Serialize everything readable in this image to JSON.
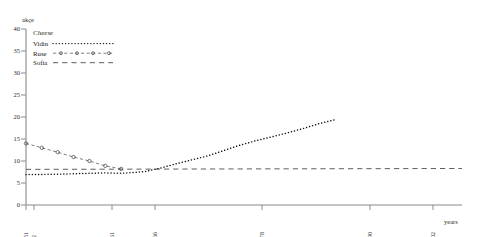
{
  "figure": {
    "axis_title_y": "akçe",
    "axis_title_x": "years",
    "legend_title": "Cheese",
    "legend_items": [
      {
        "label": "Vidin",
        "style": "dotted"
      },
      {
        "label": "Ruse",
        "style": "dashed-circles"
      },
      {
        "label": "Sofia",
        "style": "long-dashed"
      }
    ],
    "y_ticks": [
      "0",
      "5",
      "10",
      "15",
      "20",
      "25",
      "30",
      "35",
      "40"
    ],
    "x_ticks": [
      "1751",
      "1752",
      "1761",
      "1766",
      "1778",
      "1790",
      "1802"
    ]
  },
  "chart_data": {
    "type": "line",
    "title": "Cheese",
    "xlabel": "years",
    "ylabel": "akçe",
    "xlim": [
      1751,
      1806
    ],
    "ylim": [
      0,
      40
    ],
    "grid": false,
    "legend_position": "top-left",
    "x_tick_values": [
      1751,
      1752,
      1761,
      1766,
      1778,
      1790,
      1802
    ],
    "y_tick_values": [
      0,
      5,
      10,
      15,
      20,
      25,
      30,
      35,
      40
    ],
    "series": [
      {
        "name": "Vidin",
        "style": "dotted",
        "marker": "none",
        "x": [
          1751,
          1755,
          1759,
          1761,
          1763,
          1766,
          1768,
          1770,
          1772,
          1774,
          1776,
          1778,
          1780,
          1782,
          1784,
          1786,
          1788,
          1790
        ],
        "values": [
          6.9,
          7.0,
          7.2,
          7.3,
          7.2,
          7.6,
          8.4,
          9.4,
          10.3,
          11.2,
          12.4,
          13.6,
          14.6,
          15.5,
          16.4,
          17.4,
          18.5,
          19.4
        ]
      },
      {
        "name": "Ruse",
        "style": "dashed",
        "marker": "open-circle",
        "x": [
          1751,
          1753,
          1755,
          1757,
          1759,
          1761,
          1763
        ],
        "values": [
          14.0,
          13.0,
          12.0,
          10.9,
          10.0,
          8.9,
          8.2
        ]
      },
      {
        "name": "Sofia",
        "style": "long-dashed",
        "marker": "none",
        "x": [
          1751,
          1806
        ],
        "values": [
          8.1,
          8.3
        ]
      }
    ]
  }
}
